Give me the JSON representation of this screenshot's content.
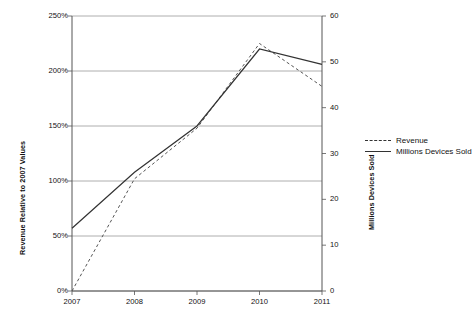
{
  "chart_data": {
    "type": "line",
    "title": "",
    "xlabel": "",
    "ylabel": "Revenue Relative to 2007 Values",
    "y2label": "Millions Devices Sold",
    "categories": [
      "2007",
      "2008",
      "2009",
      "2010",
      "2011"
    ],
    "x_tick_labels": [
      "2007",
      "2008",
      "2009",
      "2010",
      "2011"
    ],
    "y_tick_labels": [
      "0%",
      "50%",
      "100%",
      "150%",
      "200%",
      "250%"
    ],
    "y_tick_values": [
      0,
      50,
      100,
      150,
      200,
      250
    ],
    "ylim": [
      0,
      250
    ],
    "y2_tick_labels": [
      "0",
      "10",
      "20",
      "30",
      "40",
      "50",
      "60"
    ],
    "y2_tick_values": [
      0,
      10,
      20,
      30,
      40,
      50,
      60
    ],
    "y2lim": [
      0,
      60
    ],
    "grid": true,
    "legend_position": "right",
    "series": [
      {
        "name": "Revenue",
        "axis": "left",
        "style": "dashed",
        "color": "#555555",
        "values": [
          0,
          102,
          148,
          225,
          186
        ]
      },
      {
        "name": "Millions Devices Sold",
        "axis": "left",
        "style": "solid",
        "color": "#333333",
        "values": [
          57,
          108,
          150,
          220,
          206
        ],
        "values_right_axis": [
          13.7,
          25.9,
          36.0,
          52.8,
          49.4
        ]
      }
    ],
    "legend": [
      {
        "label": "Revenue",
        "style": "dashed"
      },
      {
        "label": "Millions Devices Sold",
        "style": "solid"
      }
    ]
  }
}
